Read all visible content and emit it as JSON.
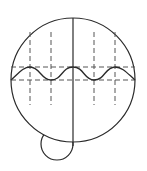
{
  "diagram": {
    "type": "geometric-figure",
    "colors": {
      "stroke": "#2a2a2a",
      "dashed": "#555555",
      "background": "#ffffff"
    },
    "main_circle": {
      "cx": 73,
      "cy": 80,
      "r": 62
    },
    "small_circle": {
      "cx": 57,
      "cy": 144,
      "r": 16
    },
    "vertical_axis": {
      "x": 73,
      "y1": 18,
      "y2": 146
    },
    "horizontal_dashed_lines": [
      {
        "y": 67,
        "x1": 11,
        "x2": 135
      },
      {
        "y": 80,
        "x1": 11,
        "x2": 135
      }
    ],
    "vertical_dashed_lines": [
      {
        "x": 30,
        "y1": 32,
        "y2": 105
      },
      {
        "x": 51,
        "y1": 32,
        "y2": 105
      },
      {
        "x": 94,
        "y1": 32,
        "y2": 105
      },
      {
        "x": 115,
        "y1": 32,
        "y2": 105
      }
    ],
    "wave": {
      "peaks_x": [
        30,
        73,
        115
      ],
      "troughs_x": [
        51,
        94
      ],
      "peak_y": 67,
      "trough_y": 80
    }
  }
}
